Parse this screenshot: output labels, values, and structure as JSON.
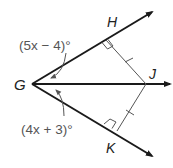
{
  "figure": {
    "points": {
      "G": "G",
      "H": "H",
      "J": "J",
      "K": "K"
    },
    "angle_labels": {
      "upper": "(5x − 4)°",
      "lower": "(4x + 3)°"
    },
    "annotations": {
      "right_angle_at": [
        "H",
        "K"
      ],
      "congruent_segments": [
        "HJ",
        "KJ"
      ],
      "rays_from_G": [
        "GH",
        "GJ",
        "GK"
      ]
    },
    "colors": {
      "ray": "#1a1a1a",
      "segment": "#555555",
      "label": "#222222",
      "angle_label": "#555555"
    }
  }
}
